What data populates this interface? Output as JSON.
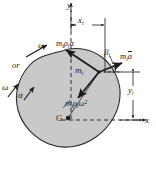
{
  "figure": {
    "type": "free-body-diagram",
    "colors": {
      "body_fill": "#c9c9c9",
      "body_stroke": "#2b2b2b",
      "line": "#1a1a1a",
      "background": "#ffffff"
    },
    "axes": {
      "y_label": "y",
      "x_label": "x"
    },
    "dimensions": {
      "horizontal": {
        "label_main": "x",
        "label_sub": "i"
      },
      "vertical": {
        "label_main": "y",
        "label_sub": "i"
      }
    },
    "points": {
      "centroid": {
        "label": "G"
      },
      "mass_element": {
        "label_main": "m",
        "label_sub": "i"
      }
    },
    "angle": {
      "label_main": "β",
      "label_sub": "i"
    },
    "vectors": [
      {
        "name": "tangential-inertia-vector",
        "text": "mᵢρᵢα",
        "parts": {
          "m": "m",
          "sub1": "i",
          "rho": "ρ",
          "sub2": "i",
          "alpha": "α"
        },
        "direction": "up-left"
      },
      {
        "name": "mass-times-accel-vector",
        "text": "mᵢā",
        "parts": {
          "m": "m",
          "sub1": "i",
          "a": "a"
        },
        "direction": "right"
      },
      {
        "name": "normal-inertia-vector",
        "text": "mᵢρᵢω²",
        "parts": {
          "m": "m",
          "sub1": "i",
          "rho": "ρ",
          "sub2": "i",
          "omega": "ω",
          "exp": "2"
        },
        "direction": "down-left"
      }
    ],
    "rotation_annotations": {
      "omega_top": "ω",
      "or_text": "or",
      "omega_bottom": "ω",
      "alpha_bottom": "α"
    }
  }
}
